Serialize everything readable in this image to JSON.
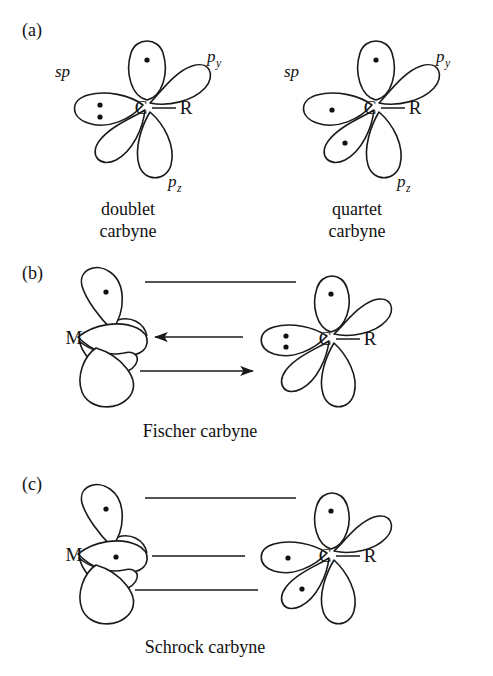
{
  "figure": {
    "background_color": "#ffffff",
    "ink_color": "#1a1a1a",
    "width": 493,
    "height": 676
  },
  "panels": [
    {
      "id": "a",
      "label": "(a)",
      "structures": [
        {
          "name": "doublet-carbyne",
          "caption_line1": "doublet",
          "caption_line2": "carbyne",
          "center_atom": "C",
          "substituent": "R",
          "orbital_labels": {
            "sp": "sp",
            "py_base": "p",
            "py_sub": "y",
            "pz_base": "p",
            "pz_sub": "z"
          },
          "electrons": {
            "sp_lobe": "lone-pair",
            "py_lobe": "single",
            "pz_lobe": "empty",
            "lower_left_lobe": "empty"
          }
        },
        {
          "name": "quartet-carbyne",
          "caption_line1": "quartet",
          "caption_line2": "carbyne",
          "center_atom": "C",
          "substituent": "R",
          "orbital_labels": {
            "sp": "sp",
            "py_base": "p",
            "py_sub": "y",
            "pz_base": "p",
            "pz_sub": "z"
          },
          "electrons": {
            "sp_lobe": "single",
            "py_lobe": "single",
            "pz_lobe": "empty",
            "lower_left_lobe": "single"
          }
        }
      ]
    },
    {
      "id": "b",
      "label": "(b)",
      "structures": [
        {
          "name": "fischer-carbyne",
          "caption": "Fischer carbyne",
          "metal_atom": "M",
          "center_atom": "C",
          "substituent": "R",
          "metal_electrons": {
            "upper_lobe": "single",
            "middle_lobe": "empty",
            "lower_lobe": "lone-pair"
          },
          "carbon_electrons": {
            "upper_lobe": "single",
            "sp_lobe": "lone-pair",
            "lower_left_lobe": "empty",
            "right_lobe": "empty",
            "bottom_lobe": "empty"
          },
          "bonds": [
            {
              "kind": "line",
              "desc": "upper-sigma-bond-line"
            },
            {
              "kind": "arrow",
              "direction": "left",
              "desc": "sigma-donation-carbon-to-metal"
            },
            {
              "kind": "arrow",
              "direction": "right",
              "desc": "pi-backdonation-metal-to-carbon"
            }
          ]
        }
      ]
    },
    {
      "id": "c",
      "label": "(c)",
      "structures": [
        {
          "name": "schrock-carbyne",
          "caption": "Schrock carbyne",
          "metal_atom": "M",
          "center_atom": "C",
          "substituent": "R",
          "metal_electrons": {
            "upper_lobe": "single",
            "middle_lobe": "single",
            "lower_lobe": "single"
          },
          "carbon_electrons": {
            "upper_lobe": "single",
            "sp_lobe": "single",
            "lower_left_lobe": "single",
            "right_lobe": "empty",
            "bottom_lobe": "empty"
          },
          "bonds": [
            {
              "kind": "line",
              "desc": "upper-covalent-bond-line"
            },
            {
              "kind": "line",
              "desc": "middle-covalent-bond-line"
            },
            {
              "kind": "line",
              "desc": "lower-covalent-bond-line"
            }
          ]
        }
      ]
    }
  ]
}
